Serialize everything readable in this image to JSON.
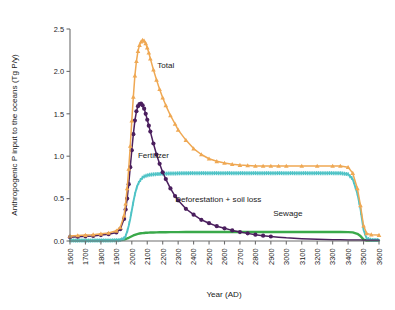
{
  "chart_data": {
    "type": "line",
    "title": "",
    "xlabel": "Year (AD)",
    "ylabel": "Anthropogenic P input to the oceans (Tg P/y)",
    "xlim": [
      1600,
      3600
    ],
    "ylim": [
      0.0,
      2.5
    ],
    "grid": false,
    "legend_position": "inline-annotations",
    "xticks": [
      1600,
      1700,
      1800,
      1900,
      2000,
      2100,
      2200,
      2300,
      2400,
      2500,
      2600,
      2700,
      2800,
      2900,
      3000,
      3100,
      3200,
      3300,
      3400,
      3500,
      3600
    ],
    "xtick_labels": [
      "1600",
      "1700",
      "1800",
      "1900",
      "2000",
      "2100",
      "2200",
      "2300",
      "2400",
      "2500",
      "2600",
      "2700",
      "2800",
      "2900",
      "3000",
      "3100",
      "3200",
      "3300",
      "3400",
      "3500",
      "3600"
    ],
    "yticks": [
      0.0,
      0.5,
      1.0,
      1.5,
      2.0,
      2.5
    ],
    "ytick_labels": [
      "0.0",
      "0.5",
      "1.0",
      "1.5",
      "2.0",
      "2.5"
    ],
    "x": [
      1600,
      1650,
      1700,
      1750,
      1800,
      1850,
      1900,
      1925,
      1950,
      1960,
      1970,
      1980,
      1990,
      2000,
      2010,
      2020,
      2030,
      2040,
      2050,
      2060,
      2070,
      2080,
      2090,
      2100,
      2110,
      2120,
      2140,
      2160,
      2180,
      2200,
      2220,
      2250,
      2280,
      2300,
      2350,
      2400,
      2450,
      2500,
      2550,
      2600,
      2650,
      2700,
      2750,
      2800,
      2850,
      2900,
      2950,
      3000,
      3100,
      3200,
      3300,
      3350,
      3400,
      3430,
      3460,
      3480,
      3500,
      3520,
      3550,
      3600
    ],
    "series": [
      {
        "name": "Total",
        "label": "Total",
        "color": "#EFA853",
        "marker": "triangle",
        "values": [
          0.06,
          0.065,
          0.07,
          0.075,
          0.085,
          0.095,
          0.12,
          0.16,
          0.3,
          0.44,
          0.62,
          0.85,
          1.12,
          1.42,
          1.7,
          1.95,
          2.12,
          2.24,
          2.31,
          2.35,
          2.37,
          2.36,
          2.33,
          2.28,
          2.22,
          2.15,
          2.02,
          1.9,
          1.79,
          1.69,
          1.6,
          1.48,
          1.38,
          1.31,
          1.19,
          1.09,
          1.02,
          0.97,
          0.94,
          0.92,
          0.905,
          0.895,
          0.89,
          0.885,
          0.885,
          0.885,
          0.885,
          0.885,
          0.885,
          0.885,
          0.885,
          0.885,
          0.87,
          0.8,
          0.62,
          0.42,
          0.18,
          0.09,
          0.075,
          0.07
        ],
        "annotation": {
          "text": "Total",
          "x": 2220,
          "y": 2.04
        }
      },
      {
        "name": "Deforestation + soil loss",
        "label": "Deforestation + soil loss",
        "color": "#4B1F5E",
        "marker": "circle",
        "values": [
          0.045,
          0.05,
          0.055,
          0.06,
          0.07,
          0.08,
          0.1,
          0.14,
          0.26,
          0.37,
          0.5,
          0.67,
          0.87,
          1.07,
          1.26,
          1.42,
          1.53,
          1.59,
          1.615,
          1.62,
          1.6,
          1.56,
          1.5,
          1.43,
          1.36,
          1.29,
          1.15,
          1.02,
          0.91,
          0.81,
          0.73,
          0.62,
          0.53,
          0.48,
          0.38,
          0.31,
          0.25,
          0.21,
          0.175,
          0.15,
          0.125,
          0.105,
          0.09,
          0.075,
          0.063,
          0.053,
          0.045,
          0.038,
          0.028,
          0.021,
          0.016,
          0.014,
          0.013,
          0.012,
          0.011,
          0.011,
          0.01,
          0.01,
          0.01,
          0.01
        ],
        "annotation": {
          "text": "Deforestation + soil loss",
          "x": 2560,
          "y": 0.455
        }
      },
      {
        "name": "Fertilizer",
        "label": "Fertilizer",
        "color": "#4FC3C6",
        "marker": "tick",
        "values": [
          0.005,
          0.005,
          0.005,
          0.005,
          0.006,
          0.007,
          0.008,
          0.012,
          0.03,
          0.06,
          0.11,
          0.18,
          0.26,
          0.36,
          0.46,
          0.55,
          0.62,
          0.67,
          0.705,
          0.73,
          0.748,
          0.76,
          0.768,
          0.775,
          0.779,
          0.782,
          0.786,
          0.789,
          0.791,
          0.793,
          0.794,
          0.796,
          0.797,
          0.798,
          0.799,
          0.8,
          0.8,
          0.8,
          0.8,
          0.8,
          0.8,
          0.8,
          0.8,
          0.8,
          0.8,
          0.8,
          0.8,
          0.8,
          0.8,
          0.8,
          0.8,
          0.799,
          0.788,
          0.73,
          0.56,
          0.38,
          0.13,
          0.03,
          0.012,
          0.01
        ],
        "annotation": {
          "text": "Fertilizer",
          "x": 2140,
          "y": 0.98
        }
      },
      {
        "name": "Sewage",
        "label": "Sewage",
        "color": "#3AA94A",
        "marker": "none",
        "values": [
          0.004,
          0.004,
          0.005,
          0.005,
          0.006,
          0.007,
          0.009,
          0.012,
          0.018,
          0.023,
          0.03,
          0.038,
          0.047,
          0.056,
          0.065,
          0.072,
          0.079,
          0.084,
          0.088,
          0.091,
          0.093,
          0.095,
          0.097,
          0.098,
          0.099,
          0.1,
          0.101,
          0.102,
          0.103,
          0.104,
          0.104,
          0.105,
          0.105,
          0.105,
          0.106,
          0.106,
          0.106,
          0.106,
          0.106,
          0.106,
          0.106,
          0.106,
          0.106,
          0.106,
          0.106,
          0.106,
          0.106,
          0.106,
          0.106,
          0.106,
          0.106,
          0.106,
          0.105,
          0.102,
          0.085,
          0.06,
          0.016,
          0.006,
          0.005,
          0.005
        ],
        "annotation": {
          "text": "Sewage",
          "x": 3010,
          "y": 0.3
        }
      }
    ]
  }
}
